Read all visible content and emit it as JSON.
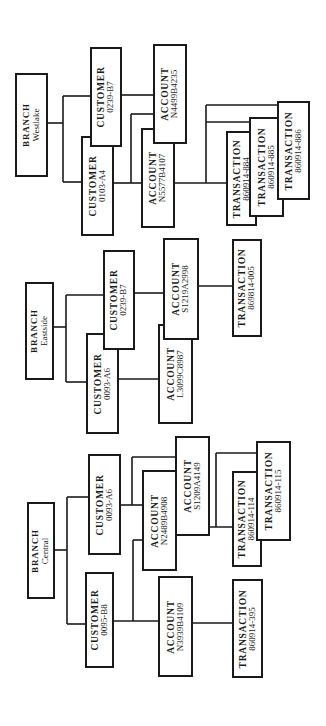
{
  "diagram": {
    "branches": [
      {
        "name": "Westlake",
        "label": "BRANCH",
        "customers": [
          {
            "label": "CUSTOMER",
            "id": "0239-B7",
            "accounts": [
              "N4499B4235"
            ]
          },
          {
            "label": "CUSTOMER",
            "id": "0103-A4",
            "accounts": [
              "N4499B4235",
              "N5577B4107"
            ]
          }
        ],
        "accounts": [
          {
            "label": "ACCOUNT",
            "id": "N4499B4235",
            "transactions": []
          },
          {
            "label": "ACCOUNT",
            "id": "N5577B4107",
            "transactions": [
              "860914-884",
              "860914-885",
              "860914-886"
            ]
          }
        ],
        "transactions": [
          {
            "label": "TRANSACTION",
            "id": "860914-884"
          },
          {
            "label": "TRANSACTION",
            "id": "860914-885"
          },
          {
            "label": "TRANSACTION",
            "id": "860914-886"
          }
        ]
      },
      {
        "name": "Eastside",
        "label": "BRANCH",
        "customers": [
          {
            "label": "CUSTOMER",
            "id": "0239-B7",
            "accounts": [
              "S1219A2998"
            ]
          },
          {
            "label": "CUSTOMER",
            "id": "0093-A6",
            "accounts": [
              "L3099C8987"
            ]
          }
        ],
        "accounts": [
          {
            "label": "ACCOUNT",
            "id": "S1219A2998",
            "transactions": [
              "869814-005"
            ]
          },
          {
            "label": "ACCOUNT",
            "id": "L3099C8987",
            "transactions": []
          }
        ],
        "transactions": [
          {
            "label": "TRANSACTION",
            "id": "869814-005"
          }
        ]
      },
      {
        "name": "Central",
        "label": "BRANCH",
        "customers": [
          {
            "label": "CUSTOMER",
            "id": "0093-A6",
            "accounts": [
              "S1209A4149",
              "N2489B4908"
            ]
          },
          {
            "label": "CUSTOMER",
            "id": "0095-B8",
            "accounts": [
              "N2489B4908",
              "N3939B4109"
            ]
          }
        ],
        "accounts": [
          {
            "label": "ACCOUNT",
            "id": "S1209A4149",
            "transactions": [
              "860914-114",
              "860914-115"
            ]
          },
          {
            "label": "ACCOUNT",
            "id": "N2489B4908",
            "transactions": [
              "860914-114",
              "860914-115"
            ]
          },
          {
            "label": "ACCOUNT",
            "id": "N3939B4109",
            "transactions": [
              "860914-395"
            ]
          }
        ],
        "transactions": [
          {
            "label": "TRANSACTION",
            "id": "860914-114"
          },
          {
            "label": "TRANSACTION",
            "id": "860914-115"
          },
          {
            "label": "TRANSACTION",
            "id": "860914-395"
          }
        ]
      }
    ]
  },
  "style": {
    "line_color": "#1a1a1a",
    "box_fill": "#ffffff",
    "background": "#ffffff"
  }
}
